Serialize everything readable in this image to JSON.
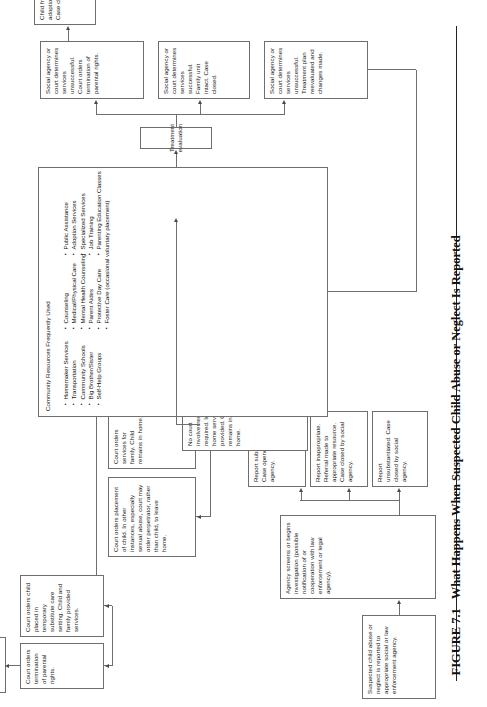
{
  "figure": {
    "number": "FIGURE 7.1",
    "title": "What Happens When Suspected Child Abuse or Neglect Is Reported"
  },
  "nodes": {
    "report": "Suspected child abuse or neglect is reported to appropriate social or law enforcement agency.",
    "screen": "Agency screens or begins investigation (possible notification of or cooperation with law enforcement or legal agency).",
    "unsubstantiated": "Report unsubstantiated. Case closed by social agency.",
    "inappropriate": "Report inappropriate. Referral made to appropriate resource. Case closed by social agency.",
    "substantiated": "Report substantiated. Case opened by social agency.",
    "court_involvement": "Court involvement required and criminal court may also become involved. (Many states now require criminal charges to be filed in cases of sexual abuse. Some states make a legal distinction—abuse by family member must be handled in civil juvenile court, by nonfamily member in criminal court.)",
    "no_court": "No court involvement required. In-home services provided. Child remains in home.",
    "placement": "Court orders placement of child. In other instances, especially sexual abuse, court may order perpetrator, rather than child, to leave home.",
    "services_family": "Court orders services for family. Child remains in home.",
    "termination": "Court orders termination of parental rights.",
    "substitute_care": "Court orders child placed in temporary substitute care setting. Child and family provided services.",
    "adoption_top": "Child freed for adoption. Case closed.",
    "treatment_eval": "Treatment evaluation",
    "unsuccessful_reeval": "Social agency or court determines services unsuccessful. Treatment plan reevaluated and changes made.",
    "successful_intact": "Social agency or court determines services successful. Family unit intact. Case closed.",
    "unsuccessful_termination": "Social agency or court determines services unsuccessful. Court orders termination of parental rights.",
    "adoption_right": "Child freed for adoption. Case closed."
  },
  "resources": {
    "title": "Community Resources Frequently Used",
    "column1": [
      "Homemaker Services",
      "Transportation",
      "Community Schools",
      "Big Brother/Sister",
      "Self-Help Groups"
    ],
    "column2": [
      "Counseling",
      "Medical/Physical Care",
      "Mental Health Counseling",
      "Parent Aides",
      "Protective Day Care",
      "Foster Care (occasional voluntary placement)"
    ],
    "column3": [
      "Public Assistance",
      "Adoption Services",
      "Specialized Services",
      "Job Training",
      "Parenting Education Classes"
    ]
  },
  "colors": {
    "box_border": "#6e6e6e",
    "connector": "#6e6e6e",
    "text": "#1a1a1a",
    "page_background": "#ffffff"
  }
}
